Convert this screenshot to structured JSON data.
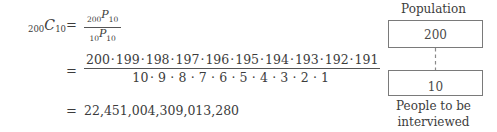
{
  "equation": {
    "lhs": {
      "left_subscript": "200",
      "symbol": "C",
      "right_subscript": "10"
    },
    "equals": "=",
    "line1_fraction": {
      "numerator": {
        "left_subscript": "200",
        "symbol": "P",
        "right_subscript": "10"
      },
      "denominator": {
        "left_subscript": "10",
        "symbol": "P",
        "right_subscript": "10"
      }
    },
    "line2_fraction": {
      "numerator_factors": [
        "200",
        "199",
        "198",
        "197",
        "196",
        "195",
        "194",
        "193",
        "192",
        "191"
      ],
      "denominator_factors": [
        "10",
        "9",
        "8",
        "7",
        "6",
        "5",
        "4",
        "3",
        "2",
        "1"
      ],
      "separator": "·"
    },
    "result": "22,451,004,309,013,280"
  },
  "diagram": {
    "title": "Population",
    "population_box_value": "200",
    "sample_box_value": "10",
    "arrow": "downward-dashed-arrow",
    "caption_line1": "People to be",
    "caption_line2": "interviewed"
  },
  "colors": {
    "text": "#3c3c3c",
    "rule": "#545454",
    "box_border": "#7a7a7a",
    "background": "#ffffff"
  }
}
